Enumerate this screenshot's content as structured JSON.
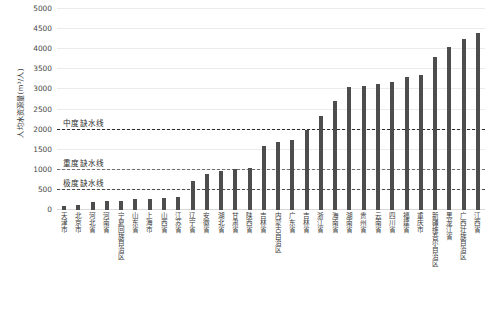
{
  "chart_data": {
    "type": "bar",
    "title": "",
    "subtitle": "",
    "xlabel": "",
    "ylabel": "人均水资源量(m³/人)",
    "ylim": [
      0,
      5000
    ],
    "ytick_values": [
      0,
      500,
      1000,
      1500,
      2000,
      2500,
      3000,
      3500,
      4000,
      4500,
      5000
    ],
    "ytick_labels": [
      "0",
      "500",
      "1000",
      "1500",
      "2000",
      "2500",
      "3000",
      "3500",
      "4000",
      "4500",
      "5000"
    ],
    "grid": true,
    "legend": "none",
    "bar_color": "#4d4d4d",
    "categories": [
      "天津市",
      "北京市",
      "河北省",
      "河南省",
      "宁夏回族自治区",
      "山东省",
      "上海市",
      "山西省",
      "江苏省",
      "辽宁省",
      "安徽省",
      "湖北省",
      "甘肃省",
      "陕西省",
      "吉林省",
      "内蒙古自治区",
      "广东省",
      "吉林省",
      "浙江省",
      "海南省",
      "湖南省",
      "贵州省",
      "云南省",
      "四川省",
      "福建省",
      "重庆市",
      "新疆维吾尔自治区",
      "黑龙江省",
      "广西壮族自治区",
      "江西省"
    ],
    "values": [
      95,
      120,
      190,
      215,
      230,
      265,
      280,
      300,
      330,
      720,
      900,
      980,
      1010,
      1050,
      1600,
      1700,
      1750,
      2000,
      2350,
      2720,
      3050,
      3080,
      3140,
      3180,
      3320,
      3350,
      3800,
      4050,
      4250,
      4400
    ],
    "thresholds": [
      {
        "name": "中度缺水线",
        "value": 2000,
        "color": "#2b2b2b"
      },
      {
        "name": "重度缺水线",
        "value": 1000,
        "color": "#6e6e6e"
      },
      {
        "name": "极度缺水线",
        "value": 500,
        "color": "#4a4a4a"
      }
    ]
  }
}
